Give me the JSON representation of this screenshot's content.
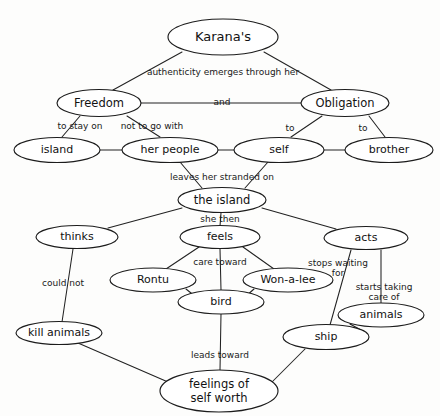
{
  "diagram": {
    "background_color": "#fdfdfc",
    "line_color": "#222222",
    "text_color": "#121212",
    "nodes": [
      {
        "id": "karanas",
        "label": "Karana's",
        "cx": 223,
        "cy": 37,
        "rx": 55,
        "ry": 18,
        "font_size": 13
      },
      {
        "id": "freedom",
        "label": "Freedom",
        "cx": 99,
        "cy": 103,
        "rx": 42,
        "ry": 13.5,
        "font_size": 11.5
      },
      {
        "id": "obligation",
        "label": "Obligation",
        "cx": 345,
        "cy": 103,
        "rx": 44,
        "ry": 13.5,
        "font_size": 11.5
      },
      {
        "id": "island",
        "label": "island",
        "cx": 57,
        "cy": 150,
        "rx": 43,
        "ry": 12.5,
        "font_size": 11
      },
      {
        "id": "her-people",
        "label": "her people",
        "cx": 170,
        "cy": 150,
        "rx": 48,
        "ry": 12.5,
        "font_size": 11
      },
      {
        "id": "self",
        "label": "self",
        "cx": 279,
        "cy": 150,
        "rx": 45,
        "ry": 12.5,
        "font_size": 11
      },
      {
        "id": "brother",
        "label": "brother",
        "cx": 389,
        "cy": 150,
        "rx": 44,
        "ry": 12.5,
        "font_size": 11
      },
      {
        "id": "the-island",
        "label": "the island",
        "cx": 222,
        "cy": 200,
        "rx": 44,
        "ry": 12.5,
        "font_size": 11.5
      },
      {
        "id": "thinks",
        "label": "thinks",
        "cx": 77,
        "cy": 237,
        "rx": 41,
        "ry": 11.5,
        "font_size": 11
      },
      {
        "id": "feels",
        "label": "feels",
        "cx": 220,
        "cy": 237,
        "rx": 40,
        "ry": 11.5,
        "font_size": 11
      },
      {
        "id": "acts",
        "label": "acts",
        "cx": 366,
        "cy": 238,
        "rx": 42,
        "ry": 11.5,
        "font_size": 11
      },
      {
        "id": "rontu",
        "label": "Rontu",
        "cx": 153,
        "cy": 280,
        "rx": 43,
        "ry": 12,
        "font_size": 11
      },
      {
        "id": "won-a-lee",
        "label": "Won-a-lee",
        "cx": 288,
        "cy": 280,
        "rx": 45,
        "ry": 12,
        "font_size": 11
      },
      {
        "id": "bird",
        "label": "bird",
        "cx": 221,
        "cy": 302,
        "rx": 43,
        "ry": 12,
        "font_size": 11
      },
      {
        "id": "animals",
        "label": "animals",
        "cx": 381,
        "cy": 315,
        "rx": 43,
        "ry": 12,
        "font_size": 11
      },
      {
        "id": "kill-animals",
        "label": "kill animals",
        "cx": 59,
        "cy": 333,
        "rx": 43,
        "ry": 11.5,
        "font_size": 11
      },
      {
        "id": "ship",
        "label": "ship",
        "cx": 326,
        "cy": 337,
        "rx": 43,
        "ry": 12.5,
        "font_size": 11
      },
      {
        "id": "feelings",
        "label": "feelings of|self worth",
        "cx": 219,
        "cy": 391,
        "rx": 59,
        "ry": 21,
        "font_size": 11.5
      }
    ],
    "edges": [
      {
        "id": "karanas-freedom",
        "from": "karanas",
        "to": "freedom",
        "points": "182,52 113,90"
      },
      {
        "id": "karanas-obligation",
        "from": "karanas",
        "to": "obligation",
        "points": "264,52 331,90"
      },
      {
        "id": "freedom-obligation",
        "from": "freedom",
        "to": "obligation",
        "points": "141,103 301,103"
      },
      {
        "id": "freedom-island",
        "from": "freedom",
        "to": "island",
        "points": "80,116 62,137"
      },
      {
        "id": "freedom-her-people",
        "from": "freedom",
        "to": "her-people",
        "points": "127,116 160,137"
      },
      {
        "id": "obligation-self",
        "from": "obligation",
        "to": "self",
        "points": "322,116 291,137"
      },
      {
        "id": "obligation-brother",
        "from": "obligation",
        "to": "brother",
        "points": "369,116 385,137"
      },
      {
        "id": "island-her-people",
        "from": "island",
        "to": "her-people",
        "points": "100,150 122,150"
      },
      {
        "id": "her-people-self",
        "from": "her-people",
        "to": "self",
        "points": "218,150 234,150"
      },
      {
        "id": "self-brother",
        "from": "self",
        "to": "brother",
        "points": "324,150 345,150"
      },
      {
        "id": "her-people-the-island",
        "from": "her-people",
        "to": "the-island",
        "points": "180,162 202,188"
      },
      {
        "id": "self-the-island",
        "from": "self",
        "to": "the-island",
        "points": "268,162 245,188"
      },
      {
        "id": "the-island-thinks",
        "from": "the-island",
        "to": "thinks",
        "points": "182,208 108,228"
      },
      {
        "id": "the-island-feels",
        "from": "the-island",
        "to": "feels",
        "points": "221,213 220,226"
      },
      {
        "id": "the-island-acts",
        "from": "the-island",
        "to": "acts",
        "points": "262,208 336,229"
      },
      {
        "id": "thinks-kill-animals",
        "from": "thinks",
        "to": "kill-animals",
        "points": "73,249 62,322"
      },
      {
        "id": "feels-rontu",
        "from": "feels",
        "to": "rontu",
        "points": "199,247 166,269"
      },
      {
        "id": "feels-bird",
        "from": "feels",
        "to": "bird",
        "points": "220,249 221,290"
      },
      {
        "id": "feels-won-a-lee",
        "from": "feels",
        "to": "won-a-lee",
        "points": "243,247 274,269"
      },
      {
        "id": "rontu-bird",
        "from": "rontu",
        "to": "bird",
        "points": "186,289 196,297"
      },
      {
        "id": "won-a-lee-bird",
        "from": "won-a-lee",
        "to": "bird",
        "points": "254,289 245,297"
      },
      {
        "id": "acts-ship",
        "from": "acts",
        "to": "ship",
        "points": "351,250 330,325"
      },
      {
        "id": "acts-animals",
        "from": "acts",
        "to": "animals",
        "points": "381,250 381,303"
      },
      {
        "id": "animals-ship",
        "from": "animals",
        "to": "ship",
        "points": "350,324 361,330"
      },
      {
        "id": "bird-feelings",
        "from": "bird",
        "to": "feelings",
        "points": "221,314 220,370"
      },
      {
        "id": "kill-animals-feelings",
        "from": "kill-animals",
        "to": "feelings",
        "points": "78,343 168,382"
      },
      {
        "id": "ship-feelings",
        "from": "ship",
        "to": "feelings",
        "points": "305,349 272,382"
      }
    ],
    "edge_labels": [
      {
        "id": "lbl-authenticity",
        "text": "authenticity emerges through her",
        "x": 223,
        "y": 72,
        "font_size": 9
      },
      {
        "id": "lbl-and",
        "text": "and",
        "x": 222,
        "y": 102,
        "font_size": 9
      },
      {
        "id": "lbl-to-stay-on",
        "text": "to stay on",
        "x": 80,
        "y": 126,
        "font_size": 9
      },
      {
        "id": "lbl-not-to-go",
        "text": "not to go with",
        "x": 152,
        "y": 126,
        "font_size": 9
      },
      {
        "id": "lbl-to-self",
        "text": "to",
        "x": 290,
        "y": 128,
        "font_size": 9
      },
      {
        "id": "lbl-to-brother",
        "text": "to",
        "x": 363,
        "y": 128,
        "font_size": 9
      },
      {
        "id": "lbl-stranded",
        "text": "leaves her stranded on",
        "x": 222,
        "y": 177,
        "font_size": 9
      },
      {
        "id": "lbl-she-then",
        "text": "she then",
        "x": 220,
        "y": 219,
        "font_size": 9
      },
      {
        "id": "lbl-could-not",
        "text": "could not",
        "x": 63,
        "y": 283,
        "font_size": 9
      },
      {
        "id": "lbl-care-toward",
        "text": "care toward",
        "x": 220,
        "y": 262,
        "font_size": 9
      },
      {
        "id": "lbl-stops-waiting",
        "text": "stops waiting|for",
        "x": 338,
        "y": 268,
        "font_size": 9
      },
      {
        "id": "lbl-starts-taking",
        "text": "starts taking|care of",
        "x": 384,
        "y": 292,
        "font_size": 9
      },
      {
        "id": "lbl-leads-toward",
        "text": "leads toward",
        "x": 220,
        "y": 355,
        "font_size": 9
      }
    ]
  }
}
